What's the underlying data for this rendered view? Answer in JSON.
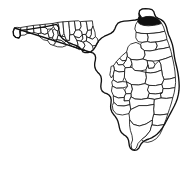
{
  "figure": {
    "kind": "county-locator-map",
    "title": "Map of Florida highlighting Nassau County",
    "caption": "",
    "width": 193,
    "height": 178
  },
  "map": {
    "state_name": "Florida",
    "state_abbr": "FL",
    "subdivision_type": "County",
    "county_count": 67,
    "projection_note": "",
    "background_color": "#ffffff",
    "county_fill_color": "#ffffff",
    "county_border_color": "#1a1a1a",
    "state_border_color": "#111111",
    "highlight_fill_color": "#101010",
    "highlighted_county": "Nassau",
    "highlighted_county_region": "Northeast Florida",
    "legend": [],
    "labels": [],
    "scale_bar": "",
    "north_arrow": ""
  },
  "shapes": {
    "state_outline": "M 14.5 28.0 L 13.2 31.6 L 13.6 35.2 L 15.8 37.4 L 19.0 38.0 L 20.4 35.4 L 20.0 31.2 L 22.6 30.2 L 27.0 29.6 L 33.0 28.6 L 39.5 27.6 L 46.0 26.6 L 52.0 25.4 L 56.5 24.4 L 58.6 27.0 L 59.0 30.4 L 59.6 33.4 L 60.4 36.0 L 62.6 38.6 L 66.0 41.0 L 69.5 43.0 L 73.0 44.4 L 76.5 45.6 L 79.5 47.4 L 81.6 49.6 L 83.0 51.8 L 85.0 52.6 L 88.0 52.6 L 91.0 51.6 L 93.6 49.4 L 95.5 46.6 L 97.0 43.4 L 99.0 40.4 L 101.6 38.0 L 104.5 36.2 L 107.6 34.8 L 110.8 33.4 L 113.4 31.4 L 115.0 28.6 L 116.2 25.6 L 118.0 23.2 L 120.6 21.8 L 124.0 21.2 L 128.0 20.8 L 132.0 20.4 L 135.5 20.0 L 138.2 19.2 L 139.4 16.6 L 139.0 13.4 L 139.6 10.6 L 142.0 9.0 L 145.5 8.6 L 149.0 8.8 L 152.0 9.6 L 153.8 11.6 L 154.6 14.4 L 155.8 16.8 L 158.2 18.4 L 161.0 19.6 L 163.6 21.6 L 165.4 24.4 L 166.6 27.6 L 167.4 31.0 L 168.4 34.4 L 169.8 37.6 L 171.2 41.0 L 172.4 44.6 L 173.2 48.4 L 173.8 52.4 L 174.4 56.6 L 175.2 60.8 L 176.2 65.0 L 177.2 69.2 L 178.0 73.4 L 178.6 77.6 L 179.0 81.8 L 179.2 86.0 L 179.0 90.2 L 178.4 94.4 L 177.4 98.4 L 176.0 102.2 L 174.4 105.8 L 172.6 109.2 L 170.8 112.6 L 169.0 116.0 L 167.2 119.4 L 165.4 122.8 L 163.6 126.0 L 161.6 129.0 L 159.4 131.8 L 157.0 134.2 L 154.4 136.2 L 151.6 137.8 L 148.8 139.0 L 146.0 140.0 L 143.4 141.4 L 141.4 143.4 L 140.0 145.8 L 138.8 148.2 L 137.0 149.8 L 134.6 150.4 L 132.2 149.8 L 130.4 148.2 L 129.4 146.0 L 129.0 143.4 L 128.6 140.6 L 127.6 138.0 L 125.8 136.0 L 123.6 134.6 L 121.6 132.8 L 120.2 130.4 L 119.4 127.6 L 118.8 124.6 L 118.0 121.6 L 116.8 118.8 L 115.2 116.4 L 113.4 114.2 L 111.8 111.8 L 110.8 109.0 L 110.6 106.0 L 111.0 103.0 L 111.2 100.0 L 110.6 97.2 L 109.0 95.0 L 106.8 93.6 L 104.4 92.8 L 102.4 91.4 L 101.2 89.2 L 100.8 86.6 L 101.0 84.0 L 101.4 81.4 L 101.4 78.8 L 100.8 76.2 L 99.4 74.0 L 97.6 72.2 L 96.0 70.2 L 95.0 67.8 L 94.6 65.2 L 94.8 62.6 L 95.4 60.0 L 95.6 57.4 L 95.0 55.0 L 93.4 53.2 Z",
    "counties": [
      {
        "name": "Escambia",
        "d": "M 14.5 28.0 L 13.2 31.6 L 13.6 35.2 L 15.8 37.4 L 19.0 38.0 L 20.4 35.4 L 20.0 31.2 L 21.0 27.8 L 17.6 27.4 Z"
      },
      {
        "name": "Santa Rosa",
        "d": "M 21.0 27.8 L 20.0 31.2 L 20.4 35.4 L 24.8 35.0 L 27.2 33.6 L 27.0 29.6 L 27.2 26.8 Z"
      },
      {
        "name": "Okaloosa",
        "d": "M 27.2 26.8 L 27.0 29.6 L 27.2 33.6 L 31.6 33.2 L 34.0 32.4 L 33.6 28.4 L 33.4 25.8 Z"
      },
      {
        "name": "Walton",
        "d": "M 33.4 25.8 L 33.6 28.4 L 34.0 32.4 L 38.0 33.6 L 41.2 33.2 L 40.6 28.0 L 40.0 25.2 Z"
      },
      {
        "name": "Holmes",
        "d": "M 40.0 25.2 L 40.6 28.0 L 45.4 27.6 L 45.2 24.6 Z"
      },
      {
        "name": "Washington",
        "d": "M 40.6 28.0 L 41.2 33.2 L 45.0 34.4 L 48.0 33.0 L 47.4 29.2 L 45.4 27.6 Z"
      },
      {
        "name": "Jackson",
        "d": "M 45.2 24.6 L 45.4 27.6 L 47.4 29.2 L 51.6 29.0 L 53.4 26.6 L 53.0 23.8 Z"
      },
      {
        "name": "Bay",
        "d": "M 41.2 33.2 L 38.0 33.6 L 39.6 36.8 L 43.6 39.8 L 47.6 40.6 L 49.4 38.0 L 48.0 33.0 L 45.0 34.4 Z"
      },
      {
        "name": "Calhoun",
        "d": "M 48.0 33.0 L 49.4 38.0 L 52.4 38.2 L 53.8 34.6 L 52.6 30.6 L 51.6 29.0 Z"
      },
      {
        "name": "Gulf",
        "d": "M 49.4 38.0 L 47.6 40.6 L 50.0 44.2 L 53.4 45.4 L 55.4 43.0 L 54.2 40.0 L 52.4 38.2 Z"
      },
      {
        "name": "Liberty",
        "d": "M 52.6 30.6 L 53.8 34.6 L 52.4 38.2 L 54.2 40.0 L 57.2 39.6 L 58.4 35.4 L 57.6 31.2 L 55.0 29.4 Z"
      },
      {
        "name": "Gadsden",
        "d": "M 53.0 23.8 L 53.4 26.6 L 55.0 29.4 L 57.6 31.2 L 59.0 28.6 L 58.6 25.2 L 57.8 22.8 Z"
      },
      {
        "name": "Leon",
        "d": "M 57.8 22.8 L 58.6 25.2 L 59.0 28.6 L 57.6 31.2 L 58.4 35.4 L 61.8 36.4 L 64.0 33.4 L 63.4 28.0 L 63.0 22.2 Z"
      },
      {
        "name": "Franklin",
        "d": "M 55.4 43.0 L 53.4 45.4 L 57.6 46.8 L 62.4 47.0 L 66.2 45.6 L 64.6 42.6 L 61.0 40.2 L 57.2 39.6 Z"
      },
      {
        "name": "Wakulla",
        "d": "M 57.2 39.6 L 61.0 40.2 L 64.6 42.6 L 66.4 40.2 L 65.0 36.6 L 61.8 36.4 L 58.4 35.4 Z"
      },
      {
        "name": "Jefferson",
        "d": "M 63.0 22.2 L 63.4 28.0 L 64.0 33.4 L 65.0 36.6 L 66.4 40.2 L 69.2 40.6 L 70.0 35.0 L 69.4 28.6 L 68.8 21.8 Z"
      },
      {
        "name": "Madison",
        "d": "M 68.8 21.8 L 69.4 28.6 L 70.0 35.0 L 73.6 34.4 L 75.6 30.4 L 75.0 25.0 L 74.4 21.4 Z"
      },
      {
        "name": "Taylor",
        "d": "M 69.2 40.6 L 66.4 40.2 L 68.6 43.8 L 72.2 46.4 L 75.8 47.8 L 78.2 45.2 L 77.0 40.6 L 75.0 37.0 L 73.6 34.4 L 70.0 35.0 Z"
      },
      {
        "name": "Hamilton",
        "d": "M 74.4 21.4 L 75.0 25.0 L 75.6 30.4 L 79.4 30.0 L 81.2 26.6 L 80.4 22.0 L 79.0 21.0 Z"
      },
      {
        "name": "Suwannee",
        "d": "M 75.6 30.4 L 73.6 34.4 L 75.0 37.0 L 79.4 37.6 L 82.4 35.0 L 81.6 31.4 L 79.4 30.0 Z"
      },
      {
        "name": "Lafayette",
        "d": "M 75.0 37.0 L 77.0 40.6 L 80.6 41.2 L 83.0 38.8 L 82.4 35.0 L 79.4 37.6 Z"
      },
      {
        "name": "Columbia",
        "d": "M 80.4 22.0 L 81.2 26.6 L 79.4 30.0 L 81.6 31.4 L 82.4 35.0 L 86.0 34.6 L 87.6 30.6 L 87.0 25.4 L 86.2 21.6 Z"
      },
      {
        "name": "Dixie",
        "d": "M 77.0 40.6 L 78.2 45.2 L 75.8 47.8 L 79.4 49.6 L 83.2 48.8 L 85.0 45.6 L 83.6 42.2 L 80.6 41.2 Z"
      },
      {
        "name": "Gilchrist",
        "d": "M 82.4 35.0 L 83.0 38.8 L 80.6 41.2 L 83.6 42.2 L 86.4 41.0 L 86.8 37.2 L 86.0 34.6 Z"
      },
      {
        "name": "Levy",
        "d": "M 83.6 42.2 L 85.0 45.6 L 83.2 48.8 L 86.6 51.6 L 90.6 52.4 L 93.4 50.0 L 92.4 45.8 L 90.0 43.0 L 86.4 41.0 Z"
      },
      {
        "name": "Baker",
        "d": "M 86.2 21.6 L 87.0 25.4 L 87.6 30.6 L 91.4 30.2 L 93.0 26.4 L 92.4 21.2 Z"
      },
      {
        "name": "Union",
        "d": "M 87.6 30.6 L 86.0 34.6 L 86.8 37.2 L 89.6 37.8 L 91.4 34.6 L 91.4 30.2 Z"
      },
      {
        "name": "Bradford",
        "d": "M 91.4 30.2 L 91.4 34.6 L 89.6 37.8 L 92.8 39.0 L 95.4 36.8 L 95.0 32.2 L 93.0 26.4 Z"
      },
      {
        "name": "Alachua",
        "d": "M 86.8 37.2 L 86.4 41.0 L 90.0 43.0 L 92.4 45.8 L 96.2 45.4 L 98.4 42.0 L 97.4 38.4 L 95.4 36.8 L 92.8 39.0 Z"
      },
      {
        "name": "Nassau",
        "d": "M 138.2 19.2 L 139.4 16.6 L 139.0 13.4 L 142.0 17.8 L 146.0 16.6 L 150.0 16.4 L 154.0 17.0 L 157.2 18.6 L 159.8 20.8 L 161.6 23.4 L 158.0 24.6 L 153.4 25.4 L 148.4 25.8 L 143.6 25.4 L 139.6 24.0 L 137.8 21.8 Z",
        "highlight": true
      },
      {
        "name": "Duval",
        "d": "M 137.8 21.8 L 139.6 24.0 L 143.6 25.4 L 148.4 25.8 L 153.4 25.4 L 158.0 24.6 L 161.6 23.4 L 163.6 27.0 L 164.8 31.2 L 160.0 32.4 L 154.0 33.2 L 147.4 33.6 L 141.0 33.4 L 136.4 32.4 L 134.8 29.0 L 135.6 25.0 Z"
      },
      {
        "name": "Clay",
        "d": "M 136.4 32.4 L 141.0 33.4 L 147.4 33.6 L 148.2 37.4 L 147.4 41.6 L 142.4 42.4 L 138.0 41.6 L 136.0 38.2 Z"
      },
      {
        "name": "St. Johns",
        "d": "M 147.4 33.6 L 154.0 33.2 L 160.0 32.4 L 164.8 31.2 L 166.2 35.2 L 167.0 39.6 L 162.0 41.0 L 156.0 42.0 L 150.4 42.4 L 147.4 41.6 L 148.2 37.4 Z"
      },
      {
        "name": "Putnam",
        "d": "M 142.4 42.4 L 147.4 41.6 L 150.4 42.4 L 156.0 42.0 L 157.2 46.0 L 155.4 50.0 L 150.0 51.0 L 144.6 50.6 L 141.0 48.0 L 140.6 44.6 Z"
      },
      {
        "name": "Flagler",
        "d": "M 156.0 42.0 L 162.0 41.0 L 167.0 39.6 L 168.4 43.2 L 169.6 47.0 L 164.0 48.4 L 158.4 49.2 L 155.4 50.0 L 157.2 46.0 Z"
      },
      {
        "name": "Marion",
        "d": "M 131.0 44.0 L 136.0 42.4 L 140.6 44.6 L 141.0 48.0 L 144.6 50.6 L 145.0 55.2 L 143.0 59.0 L 137.0 60.0 L 131.0 59.4 L 127.4 56.6 L 126.6 51.8 L 128.0 47.0 Z"
      },
      {
        "name": "Volusia",
        "d": "M 144.6 50.6 L 150.0 51.0 L 155.4 50.0 L 158.4 49.2 L 164.0 48.4 L 169.6 47.0 L 171.0 51.4 L 172.0 56.0 L 166.0 58.4 L 159.4 60.4 L 153.0 61.2 L 147.4 60.6 L 143.0 59.0 L 145.0 55.2 Z"
      },
      {
        "name": "Citrus",
        "d": "M 122.4 55.4 L 126.6 51.8 L 127.4 56.6 L 126.0 60.4 L 122.0 60.8 L 119.8 58.4 Z"
      },
      {
        "name": "Sumter",
        "d": "M 127.4 56.6 L 131.0 59.4 L 132.0 63.8 L 130.0 67.4 L 125.4 67.8 L 123.0 64.6 L 126.0 60.4 Z"
      },
      {
        "name": "Lake",
        "d": "M 131.0 59.4 L 137.0 60.0 L 143.0 59.0 L 147.4 60.6 L 148.0 65.2 L 146.0 69.8 L 140.0 71.0 L 134.6 70.4 L 132.0 67.4 L 132.0 63.8 Z"
      },
      {
        "name": "Seminole",
        "d": "M 147.4 60.6 L 153.0 61.2 L 155.0 64.6 L 153.6 68.0 L 148.6 68.4 L 148.0 65.2 Z"
      },
      {
        "name": "Orange",
        "d": "M 148.0 65.2 L 148.6 68.4 L 153.6 68.0 L 155.0 64.6 L 159.4 60.4 L 161.0 64.8 L 161.6 70.0 L 156.0 72.2 L 150.4 73.0 L 146.0 72.4 L 146.0 69.8 Z"
      },
      {
        "name": "Brevard",
        "d": "M 159.4 60.4 L 166.0 58.4 L 172.0 56.0 L 173.2 61.0 L 174.2 66.4 L 175.0 72.0 L 175.4 77.4 L 169.6 79.0 L 164.0 79.4 L 162.4 75.2 L 161.6 70.0 L 161.0 64.8 Z"
      },
      {
        "name": "Hernando",
        "d": "M 119.8 58.4 L 122.0 60.8 L 126.0 60.4 L 123.0 64.6 L 118.4 65.0 L 116.6 62.0 Z"
      },
      {
        "name": "Pasco",
        "d": "M 116.6 62.0 L 118.4 65.0 L 123.0 64.6 L 125.4 67.8 L 124.6 71.4 L 119.0 72.0 L 114.6 70.4 L 113.6 66.0 Z"
      },
      {
        "name": "Polk",
        "d": "M 125.4 67.8 L 130.0 67.4 L 132.0 67.4 L 134.6 70.4 L 140.0 71.0 L 146.0 72.4 L 146.4 78.0 L 145.0 83.6 L 138.4 85.0 L 131.6 84.6 L 126.8 82.0 L 124.4 77.2 L 124.6 71.4 Z"
      },
      {
        "name": "Osceola",
        "d": "M 146.0 72.4 L 150.4 73.0 L 156.0 72.2 L 161.6 70.0 L 162.4 75.2 L 164.0 79.4 L 162.0 84.2 L 155.4 85.6 L 149.0 85.4 L 145.0 83.6 L 146.4 78.0 Z"
      },
      {
        "name": "Pinellas",
        "d": "M 113.6 66.0 L 114.6 70.4 L 113.4 74.6 L 111.4 78.0 L 109.8 75.0 L 110.6 70.4 L 111.0 66.8 Z"
      },
      {
        "name": "Hillsborough",
        "d": "M 114.6 70.4 L 119.0 72.0 L 124.6 71.4 L 124.4 77.2 L 122.6 81.6 L 117.4 82.4 L 113.4 80.0 L 113.4 74.6 Z"
      },
      {
        "name": "Manatee",
        "d": "M 113.4 80.0 L 117.4 82.4 L 122.6 81.6 L 126.8 82.0 L 127.4 86.6 L 122.4 88.0 L 116.4 88.2 L 112.6 86.2 L 111.8 82.4 Z"
      },
      {
        "name": "Hardee",
        "d": "M 126.8 82.0 L 131.6 84.6 L 132.4 89.4 L 131.0 93.6 L 126.0 93.8 L 124.6 90.0 L 127.4 86.6 Z"
      },
      {
        "name": "Okeechobee",
        "d": "M 149.0 85.4 L 155.4 85.6 L 162.0 84.2 L 163.4 88.6 L 162.0 93.0 L 155.4 94.0 L 149.4 93.4 L 147.4 90.0 Z"
      },
      {
        "name": "Highlands",
        "d": "M 131.6 84.6 L 138.4 85.0 L 145.0 83.6 L 149.0 85.4 L 147.4 90.0 L 149.4 93.4 L 148.0 98.2 L 141.4 99.4 L 135.0 99.0 L 131.0 96.8 L 131.0 93.6 L 132.4 89.4 Z"
      },
      {
        "name": "Sarasota",
        "d": "M 112.6 86.2 L 116.4 88.2 L 122.4 88.0 L 124.6 90.0 L 126.0 93.8 L 124.2 97.4 L 118.4 98.0 L 113.6 96.0 L 111.6 91.4 Z"
      },
      {
        "name": "DeSoto",
        "d": "M 126.0 93.8 L 131.0 93.6 L 131.0 96.8 L 129.4 100.6 L 124.0 101.0 L 124.2 97.4 Z"
      },
      {
        "name": "St. Lucie",
        "d": "M 162.0 84.2 L 164.0 79.4 L 169.6 79.0 L 175.4 77.4 L 175.6 82.6 L 175.0 87.6 L 169.0 88.6 L 163.4 88.6 Z"
      },
      {
        "name": "Martin",
        "d": "M 163.4 88.6 L 169.0 88.6 L 175.0 87.6 L 174.2 92.8 L 172.8 97.6 L 166.4 98.4 L 161.0 98.0 L 160.4 93.4 L 162.0 93.0 Z"
      },
      {
        "name": "Glades",
        "d": "M 149.4 93.4 L 155.4 94.0 L 162.0 93.0 L 160.4 93.4 L 161.0 98.0 L 154.6 99.4 L 148.0 98.2 Z"
      },
      {
        "name": "Charlotte",
        "d": "M 113.6 96.0 L 118.4 98.0 L 124.2 97.4 L 124.0 101.0 L 129.4 100.6 L 130.0 104.6 L 124.0 106.0 L 117.6 105.6 L 114.0 102.6 Z"
      },
      {
        "name": "Lee",
        "d": "M 114.0 102.6 L 117.6 105.6 L 124.0 106.0 L 130.0 104.6 L 131.0 109.4 L 129.0 113.6 L 122.4 115.0 L 116.4 114.0 L 113.0 110.0 L 112.4 106.0 Z"
      },
      {
        "name": "Hendry",
        "d": "M 130.0 104.6 L 129.4 100.6 L 131.0 96.8 L 135.0 99.0 L 141.4 99.4 L 148.0 98.2 L 154.6 99.4 L 154.0 104.4 L 147.0 105.6 L 139.0 105.6 L 131.0 109.4 Z"
      },
      {
        "name": "Palm Beach",
        "d": "M 154.6 99.4 L 161.0 98.0 L 166.4 98.4 L 172.8 97.6 L 171.4 103.0 L 169.6 108.6 L 167.8 114.0 L 160.0 115.0 L 154.0 114.4 L 153.6 109.2 L 154.0 104.4 Z"
      },
      {
        "name": "Collier",
        "d": "M 131.0 109.4 L 139.0 105.6 L 147.0 105.6 L 154.0 104.4 L 153.6 109.2 L 154.0 114.4 L 152.4 120.0 L 146.0 124.0 L 139.4 126.0 L 133.4 124.4 L 129.8 120.0 L 129.0 113.6 Z"
      },
      {
        "name": "Broward",
        "d": "M 154.0 114.4 L 160.0 115.0 L 167.8 114.0 L 166.0 119.4 L 164.0 124.6 L 157.6 125.6 L 152.0 125.0 L 152.4 120.0 Z"
      },
      {
        "name": "Monroe",
        "d": "M 129.8 120.0 L 133.4 124.4 L 139.4 126.0 L 146.0 124.0 L 152.4 120.0 L 152.0 125.0 L 150.0 131.0 L 146.0 136.0 L 141.6 139.6 L 138.0 143.4 L 136.4 148.0 L 134.0 150.0 L 131.6 148.4 L 131.0 144.2 L 132.6 140.0 L 132.0 135.4 L 130.4 130.4 L 129.6 125.2 Z"
      },
      {
        "name": "Miami-Dade",
        "d": "M 152.0 125.0 L 157.6 125.6 L 164.0 124.6 L 162.2 129.6 L 159.8 134.4 L 156.4 138.6 L 152.0 141.2 L 147.6 142.4 L 143.4 141.6 L 141.6 139.6 L 146.0 136.0 L 150.0 131.0 Z"
      }
    ]
  }
}
